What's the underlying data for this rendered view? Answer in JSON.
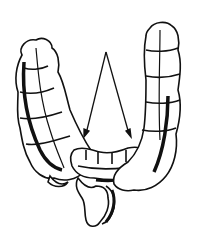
{
  "figure": {
    "annotations": [
      {
        "type": "arrow",
        "from": [
          106,
          52
        ],
        "to": [
          85,
          136
        ]
      },
      {
        "type": "arrow",
        "from": [
          106,
          52
        ],
        "to": [
          130,
          136
        ]
      }
    ],
    "colors": {
      "ink": "#111111",
      "paper": "#ffffff"
    }
  }
}
